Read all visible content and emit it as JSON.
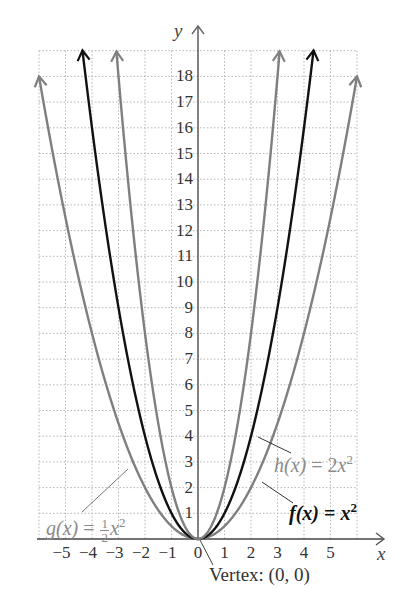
{
  "chart_data": {
    "type": "line",
    "title": "",
    "xlabel": "x",
    "ylabel": "y",
    "xlim": [
      -6,
      6
    ],
    "ylim": [
      0,
      19
    ],
    "grid": true,
    "x_ticks": [
      "-5",
      "-4",
      "-3",
      "-2",
      "-1",
      "0",
      "1",
      "2",
      "3",
      "4",
      "5"
    ],
    "y_ticks": [
      "1",
      "2",
      "3",
      "4",
      "5",
      "6",
      "7",
      "8",
      "9",
      "10",
      "11",
      "12",
      "13",
      "14",
      "15",
      "16",
      "17",
      "18"
    ],
    "series": [
      {
        "name": "g(x) = 1/2 x^2",
        "color": "#7f7f7f",
        "formula": "0.5*x^2",
        "x": [
          -6,
          -5,
          -4,
          -3,
          -2,
          -1,
          0,
          1,
          2,
          3,
          4,
          5,
          6
        ],
        "values": [
          18,
          12.5,
          8,
          4.5,
          2,
          0.5,
          0,
          0.5,
          2,
          4.5,
          8,
          12.5,
          18
        ]
      },
      {
        "name": "f(x) = x^2",
        "color": "#111111",
        "formula": "x^2",
        "x": [
          -4.36,
          -4,
          -3,
          -2,
          -1,
          0,
          1,
          2,
          3,
          4,
          4.36
        ],
        "values": [
          19,
          16,
          9,
          4,
          1,
          0,
          1,
          4,
          9,
          16,
          19
        ]
      },
      {
        "name": "h(x) = 2x^2",
        "color": "#7f7f7f",
        "formula": "2*x^2",
        "x": [
          -3.08,
          -3,
          -2,
          -1,
          0,
          1,
          2,
          3,
          3.08
        ],
        "values": [
          19,
          18,
          8,
          2,
          0,
          2,
          8,
          18,
          19
        ]
      }
    ],
    "annotations": [
      {
        "text": "Vertex: (0, 0)",
        "x": 0,
        "y": 0
      },
      {
        "text": "g(x) = 1/2 x^2",
        "points_to": [
          -2.6,
          3.4
        ]
      },
      {
        "text": "h(x) = 2x^2",
        "points_to": [
          1.3,
          3.4
        ]
      },
      {
        "text": "f(x) = x^2",
        "points_to": [
          1.95,
          3.8
        ]
      }
    ]
  },
  "labels": {
    "x_axis": "x",
    "y_axis": "y",
    "vertex": "Vertex: (0, 0)",
    "g": {
      "name": "g(x)",
      "eq": "=",
      "num": "1",
      "den": "2",
      "var": "x",
      "exp": "2"
    },
    "h": {
      "name": "h(x)",
      "eq": "= 2",
      "var": "x",
      "exp": "2"
    },
    "f": {
      "name": "f(x)",
      "eq": "=",
      "var": "x",
      "exp": "2"
    }
  }
}
